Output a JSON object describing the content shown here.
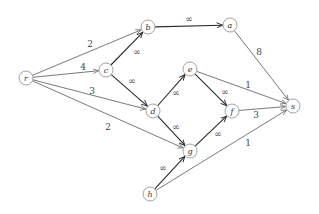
{
  "diagram": {
    "type": "flow-network",
    "nodes": [
      {
        "id": "r",
        "label": "r",
        "x": 26,
        "y": 78
      },
      {
        "id": "b",
        "label": "b",
        "x": 148,
        "y": 27
      },
      {
        "id": "a",
        "label": "a",
        "x": 230,
        "y": 25
      },
      {
        "id": "c",
        "label": "c",
        "x": 106,
        "y": 70
      },
      {
        "id": "e",
        "label": "e",
        "x": 190,
        "y": 69
      },
      {
        "id": "d",
        "label": "d",
        "x": 153,
        "y": 111
      },
      {
        "id": "f",
        "label": "f",
        "x": 232,
        "y": 111
      },
      {
        "id": "s",
        "label": "s",
        "x": 293,
        "y": 106
      },
      {
        "id": "g",
        "label": "g",
        "x": 190,
        "y": 151
      },
      {
        "id": "h",
        "label": "h",
        "x": 150,
        "y": 194
      }
    ],
    "edges": [
      {
        "from": "r",
        "to": "b",
        "label": "2",
        "kind": "finite",
        "lx": 90,
        "ly": 44
      },
      {
        "from": "r",
        "to": "c",
        "label": "4",
        "kind": "finite",
        "lx": 83,
        "ly": 67
      },
      {
        "from": "r",
        "to": "d",
        "label": "3",
        "kind": "finite",
        "lx": 92,
        "ly": 91
      },
      {
        "from": "r",
        "to": "g",
        "label": "2",
        "kind": "finite",
        "lx": 108,
        "ly": 127
      },
      {
        "from": "c",
        "to": "b",
        "label": "∞",
        "kind": "infinite",
        "lx": 137,
        "ly": 52
      },
      {
        "from": "c",
        "to": "d",
        "label": "∞",
        "kind": "infinite",
        "lx": 132,
        "ly": 81
      },
      {
        "from": "b",
        "to": "a",
        "label": "∞",
        "kind": "infinite",
        "lx": 189,
        "ly": 19
      },
      {
        "from": "a",
        "to": "s",
        "label": "8",
        "kind": "finite",
        "lx": 259,
        "ly": 52
      },
      {
        "from": "d",
        "to": "e",
        "label": "∞",
        "kind": "infinite",
        "lx": 176,
        "ly": 93
      },
      {
        "from": "d",
        "to": "g",
        "label": "∞",
        "kind": "infinite",
        "lx": 176,
        "ly": 127
      },
      {
        "from": "e",
        "to": "f",
        "label": "∞",
        "kind": "infinite",
        "lx": 225,
        "ly": 92
      },
      {
        "from": "e",
        "to": "s",
        "label": "1",
        "kind": "finite",
        "lx": 248,
        "ly": 85
      },
      {
        "from": "g",
        "to": "f",
        "label": "∞",
        "kind": "infinite",
        "lx": 218,
        "ly": 134
      },
      {
        "from": "f",
        "to": "s",
        "label": "3",
        "kind": "finite",
        "lx": 256,
        "ly": 115
      },
      {
        "from": "h",
        "to": "g",
        "label": "∞",
        "kind": "infinite",
        "lx": 163,
        "ly": 168
      },
      {
        "from": "h",
        "to": "s",
        "label": "1",
        "kind": "finite",
        "lx": 248,
        "ly": 143
      }
    ]
  }
}
